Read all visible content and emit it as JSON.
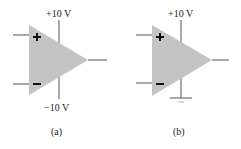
{
  "diagram": {
    "panels": [
      {
        "id": "a",
        "caption": "(a)",
        "component": "op-amp",
        "inputs": {
          "noninverting_symbol": "+",
          "inverting_symbol": "−"
        },
        "positive_supply_label": "+10 V",
        "negative_supply_label": "−10 V"
      },
      {
        "id": "b",
        "caption": "(b)",
        "component": "op-amp",
        "inputs": {
          "noninverting_symbol": "+",
          "inverting_symbol": "−"
        },
        "positive_supply_label": "+10 V",
        "negative_supply": "ground"
      }
    ],
    "colors": {
      "triangle_fill": "#c4c4c4",
      "wire": "#555555",
      "symbol": "#111111"
    }
  }
}
